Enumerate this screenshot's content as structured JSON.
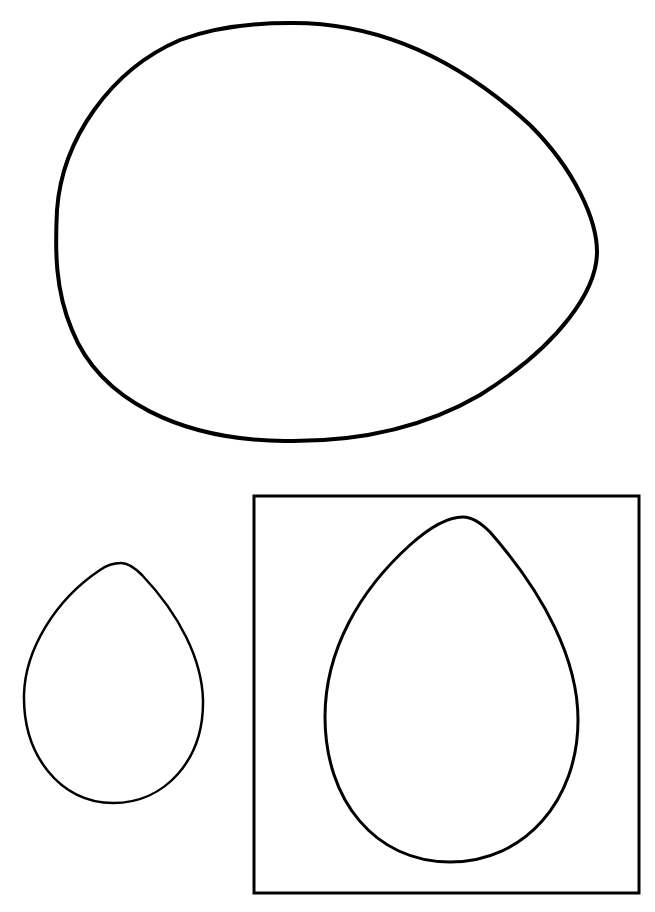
{
  "page": {
    "background": "#ffffff",
    "stroke_color": "#000000"
  },
  "shapes": [
    {
      "name": "large-egg",
      "orientation": "pointed-end-right"
    },
    {
      "name": "small-egg",
      "orientation": "pointed-end-up"
    },
    {
      "name": "framed-egg",
      "orientation": "pointed-end-up",
      "framed": true
    }
  ]
}
